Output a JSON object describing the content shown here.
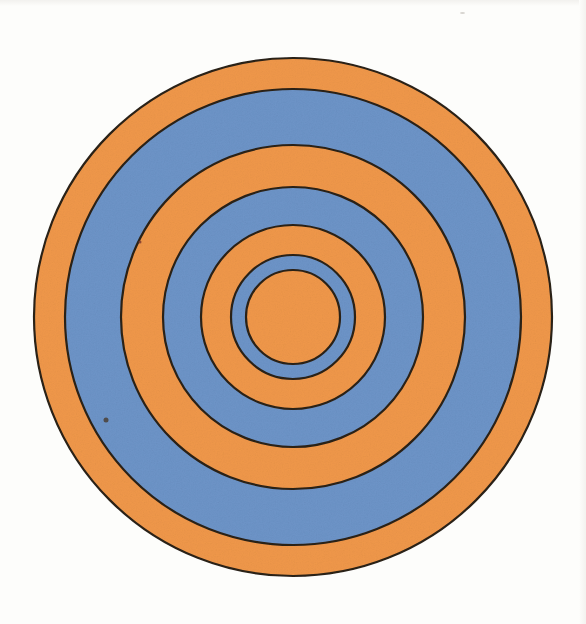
{
  "page": {
    "background_color": "#fdfdfb",
    "caption": ""
  },
  "figure": {
    "name": "concentric-circles-target",
    "center_x": 293,
    "center_y": 317,
    "stroke_color": "#2b2118",
    "stroke_width": 2.2,
    "colors": {
      "orange": "#f0984a",
      "blue": "#6d94c8",
      "outline": "#2b2118",
      "paper": "#fdfdfb"
    },
    "ring_count": 7,
    "rings": [
      {
        "index": 1,
        "label": "outer-orange-ring",
        "radius": 259,
        "fill": "#f0984a",
        "color_name": "orange"
      },
      {
        "index": 2,
        "label": "outer-blue-ring",
        "radius": 228,
        "fill": "#6d94c8",
        "color_name": "blue"
      },
      {
        "index": 3,
        "label": "mid-orange-ring",
        "radius": 172,
        "fill": "#f0984a",
        "color_name": "orange"
      },
      {
        "index": 4,
        "label": "mid-blue-ring",
        "radius": 130,
        "fill": "#6d94c8",
        "color_name": "blue"
      },
      {
        "index": 5,
        "label": "inner-orange-ring",
        "radius": 92,
        "fill": "#f0984a",
        "color_name": "orange"
      },
      {
        "index": 6,
        "label": "inner-blue-ring",
        "radius": 62,
        "fill": "#6d94c8",
        "color_name": "blue"
      },
      {
        "index": 7,
        "label": "center-orange-disc",
        "radius": 47,
        "fill": "#f0984a",
        "color_name": "orange"
      }
    ],
    "marks": [
      {
        "name": "ink-speck-left-upper",
        "x": 140,
        "y": 242,
        "w": 3,
        "h": 3,
        "color": "#7b3a2e"
      },
      {
        "name": "ink-speck-left-lower",
        "x": 106,
        "y": 420,
        "w": 5,
        "h": 5,
        "color": "#4a4036"
      }
    ]
  },
  "chart_data": {
    "type": "pie",
    "xlabel": "",
    "ylabel": "",
    "categories": [
      "outer-orange-ring",
      "outer-blue-ring",
      "mid-orange-ring",
      "mid-blue-ring",
      "inner-orange-ring",
      "inner-blue-ring",
      "center-orange-disc"
    ],
    "values": [
      259,
      228,
      172,
      130,
      92,
      62,
      47
    ],
    "value_unit": "px radius",
    "series": [
      {
        "name": "outer radius (px)",
        "values": [
          259,
          228,
          172,
          130,
          92,
          62,
          47
        ]
      },
      {
        "name": "band width (px)",
        "values": [
          31,
          56,
          42,
          38,
          30,
          15,
          47
        ]
      }
    ],
    "legend": [
      "orange",
      "blue"
    ],
    "legend_position": "none",
    "grid": false
  }
}
